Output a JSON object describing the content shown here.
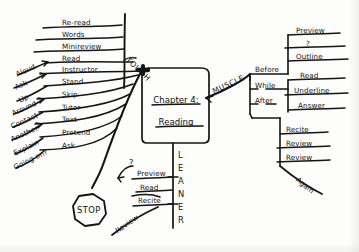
{
  "document": {
    "type": "hand-drawn-mind-map",
    "title": "Chapter 4: Reading",
    "ink_color": "#141414",
    "paper_color": "#fdfdfc"
  },
  "center": {
    "line1": "Chapter 4:",
    "line2": "Reading"
  },
  "branches": {
    "tough": {
      "label": "TOUGH",
      "items": [
        {
          "label": "Re-read",
          "modifier": ""
        },
        {
          "label": "Words",
          "modifier": ""
        },
        {
          "label": "Minireview",
          "modifier": ""
        },
        {
          "label": "Read",
          "modifier": "Aloud"
        },
        {
          "label": "Instructor",
          "modifier": "Ask"
        },
        {
          "label": "Stand",
          "modifier": "Up"
        },
        {
          "label": "Skip",
          "modifier": "Around"
        },
        {
          "label": "Tutor",
          "modifier": "Contact"
        },
        {
          "label": "Text",
          "modifier": "Another"
        },
        {
          "label": "Pretend",
          "modifier": "Explain"
        },
        {
          "label": "Ask",
          "modifier": "Going on?"
        }
      ]
    },
    "muscle": {
      "label": "MUSCLE",
      "phases": [
        {
          "label": "Before",
          "items": [
            "Preview",
            "?",
            "Outline"
          ]
        },
        {
          "label": "While",
          "items": [
            "Read",
            "Underline",
            "Answer"
          ]
        },
        {
          "label": "After",
          "items": [
            "Recite",
            "Review",
            "Review"
          ]
        }
      ],
      "after_note": "Again"
    },
    "leaner": {
      "label_letters": [
        "L",
        "E",
        "A",
        "N",
        "E",
        "R"
      ],
      "label": "LEANER",
      "items": [
        "Preview",
        "Read",
        "Recite"
      ],
      "question_mark": "?",
      "review_note": "Review"
    }
  },
  "stop_sign": {
    "label": "STOP"
  }
}
